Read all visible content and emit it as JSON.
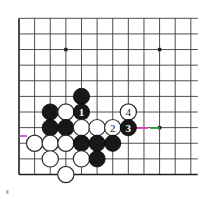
{
  "diagram": {
    "kind": "go-board-diagram",
    "board_size": 12,
    "grid": {
      "origin_x": 19.0,
      "origin_y": 18.3,
      "spacing": 15.62,
      "cols": 12,
      "rows": 11,
      "line_color": "#3a3a3a",
      "edge_color": "#1d1d1d",
      "background": "#ffffff"
    },
    "star_points": [
      {
        "col": 3,
        "row": 2
      },
      {
        "col": 9,
        "row": 2
      },
      {
        "col": 9,
        "row": 7
      }
    ],
    "stones": [
      {
        "col": 4,
        "row": 5,
        "color": "black",
        "label": ""
      },
      {
        "col": 2,
        "row": 6,
        "color": "black",
        "label": ""
      },
      {
        "col": 3,
        "row": 6,
        "color": "white",
        "label": ""
      },
      {
        "col": 4,
        "row": 6,
        "color": "black",
        "label": "1"
      },
      {
        "col": 7,
        "row": 6,
        "color": "white",
        "label": "4"
      },
      {
        "col": 2,
        "row": 7,
        "color": "black",
        "label": ""
      },
      {
        "col": 3,
        "row": 7,
        "color": "black",
        "label": ""
      },
      {
        "col": 4,
        "row": 7,
        "color": "white",
        "label": ""
      },
      {
        "col": 5,
        "row": 7,
        "color": "white",
        "label": ""
      },
      {
        "col": 6,
        "row": 7,
        "color": "white",
        "label": "2"
      },
      {
        "col": 7,
        "row": 7,
        "color": "black",
        "label": "3"
      },
      {
        "col": 1,
        "row": 8,
        "color": "white",
        "label": ""
      },
      {
        "col": 2,
        "row": 8,
        "color": "white",
        "label": ""
      },
      {
        "col": 3,
        "row": 8,
        "color": "white",
        "label": ""
      },
      {
        "col": 4,
        "row": 8,
        "color": "black",
        "label": ""
      },
      {
        "col": 5,
        "row": 8,
        "color": "black",
        "label": ""
      },
      {
        "col": 6,
        "row": 8,
        "color": "black",
        "label": ""
      },
      {
        "col": 2,
        "row": 9,
        "color": "white",
        "label": ""
      },
      {
        "col": 4,
        "row": 9,
        "color": "white",
        "label": ""
      },
      {
        "col": 5,
        "row": 9,
        "color": "black",
        "label": ""
      },
      {
        "col": 3,
        "row": 10,
        "color": "white",
        "label": ""
      }
    ],
    "move_labels": [
      {
        "number": "1",
        "color": "black",
        "col": 4,
        "row": 6
      },
      {
        "number": "2",
        "color": "white",
        "col": 6,
        "row": 7
      },
      {
        "number": "3",
        "color": "black",
        "col": 7,
        "row": 7
      },
      {
        "number": "4",
        "color": "white",
        "col": 7,
        "row": 6
      }
    ],
    "highlight_segments": [
      {
        "name": "magenta-right-of-move3",
        "color": "#e23bb8",
        "x1": 132.0,
        "x2": 148.0,
        "y": 128.0
      },
      {
        "name": "green-left-of-hoshi",
        "color": "#2f9e3f",
        "x1": 150.0,
        "x2": 160.0,
        "y": 128.0
      },
      {
        "name": "magenta-left-edge",
        "color": "#c94fd0",
        "x1": 19.0,
        "x2": 27.0,
        "y": 136.0
      },
      {
        "name": "green-under-black-a",
        "color": "#2f9e3f",
        "x1": 45.0,
        "x2": 53.0,
        "y": 136.0
      },
      {
        "name": "magenta-under-black-b",
        "color": "#a234c6",
        "x1": 61.0,
        "x2": 69.0,
        "y": 136.0
      }
    ],
    "corner_tick": {
      "name": "bottom-left-tick",
      "x": 6,
      "y": 190,
      "color": "#b9b9b9"
    }
  }
}
